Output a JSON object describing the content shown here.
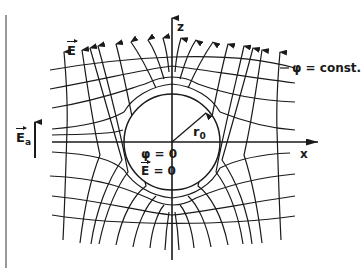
{
  "diagram": {
    "title": "",
    "labels": {
      "z_axis": "z",
      "x_axis": "x",
      "field_E": "E",
      "field_Ea": "E",
      "field_Ea_sub": "a",
      "equipotential": "φ = const.",
      "radius": "r",
      "radius_sub": "0",
      "inside_phi": "φ = 0",
      "inside_E_letter": "E",
      "inside_E_value": " = 0"
    },
    "colors": {
      "ink": "#1a1a1a",
      "background": "#ffffff"
    }
  }
}
